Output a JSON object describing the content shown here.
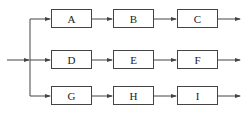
{
  "diagram": {
    "type": "parallel-series block diagram",
    "rows": [
      {
        "blocks": [
          {
            "label": "A"
          },
          {
            "label": "B"
          },
          {
            "label": "C"
          }
        ]
      },
      {
        "blocks": [
          {
            "label": "D"
          },
          {
            "label": "E"
          },
          {
            "label": "F"
          }
        ]
      },
      {
        "blocks": [
          {
            "label": "G"
          },
          {
            "label": "H"
          },
          {
            "label": "I"
          }
        ]
      }
    ],
    "colors": {
      "line": "#444444",
      "box_border": "#444444",
      "text": "#222222",
      "background": "#ffffff"
    }
  }
}
